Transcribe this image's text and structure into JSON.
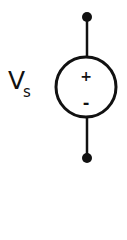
{
  "diagram": {
    "type": "circuit-symbol",
    "component": "independent voltage source",
    "label_main": "V",
    "label_sub": "s",
    "polarity_top": "+",
    "polarity_bottom": "-",
    "stroke_color": "#111111"
  }
}
